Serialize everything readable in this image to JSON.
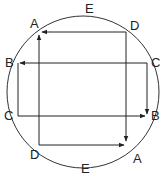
{
  "diagram": {
    "circle": {
      "cx": 83,
      "cy": 92,
      "r": 76
    },
    "labels": [
      {
        "id": "E-top",
        "text": "E",
        "x": 85,
        "y": 13
      },
      {
        "id": "A-top",
        "text": "A",
        "x": 30,
        "y": 28
      },
      {
        "id": "D-top",
        "text": "D",
        "x": 130,
        "y": 30
      },
      {
        "id": "B-left",
        "text": "B",
        "x": 5,
        "y": 67
      },
      {
        "id": "C-right",
        "text": "C",
        "x": 151,
        "y": 67
      },
      {
        "id": "C-left",
        "text": "C",
        "x": 4,
        "y": 120
      },
      {
        "id": "B-right",
        "text": "B",
        "x": 151,
        "y": 120
      },
      {
        "id": "D-bottom",
        "text": "D",
        "x": 30,
        "y": 159
      },
      {
        "id": "A-bottom",
        "text": "A",
        "x": 133,
        "y": 163
      },
      {
        "id": "E-bottom",
        "text": "E",
        "x": 81,
        "y": 173
      }
    ],
    "edges": [
      {
        "from": "D-top",
        "to": "A-top",
        "x1": 126,
        "y1": 32,
        "x2": 42,
        "y2": 32,
        "arrow": true
      },
      {
        "from": "D-top",
        "to": "A-bottom",
        "x1": 126,
        "y1": 32,
        "x2": 126,
        "y2": 141,
        "arrow": true
      },
      {
        "from": "D-bottom",
        "to": "A-top",
        "x1": 39,
        "y1": 145,
        "x2": 39,
        "y2": 35,
        "arrow": true
      },
      {
        "from": "C-right",
        "to": "B-left",
        "x1": 147,
        "y1": 63,
        "x2": 20,
        "y2": 63,
        "arrow": true
      },
      {
        "from": "C-right",
        "to": "B-right",
        "x1": 147,
        "y1": 63,
        "x2": 147,
        "y2": 114,
        "arrow": true
      },
      {
        "from": "B-left",
        "to": "C-left",
        "x1": 18,
        "y1": 63,
        "x2": 18,
        "y2": 116,
        "arrow": false
      },
      {
        "from": "C-left",
        "to": "B-right",
        "x1": 18,
        "y1": 116,
        "x2": 145,
        "y2": 116,
        "arrow": true
      },
      {
        "from": "D-bottom",
        "to": "A-bottom",
        "x1": 39,
        "y1": 145,
        "x2": 124,
        "y2": 145,
        "arrow": true
      }
    ]
  }
}
